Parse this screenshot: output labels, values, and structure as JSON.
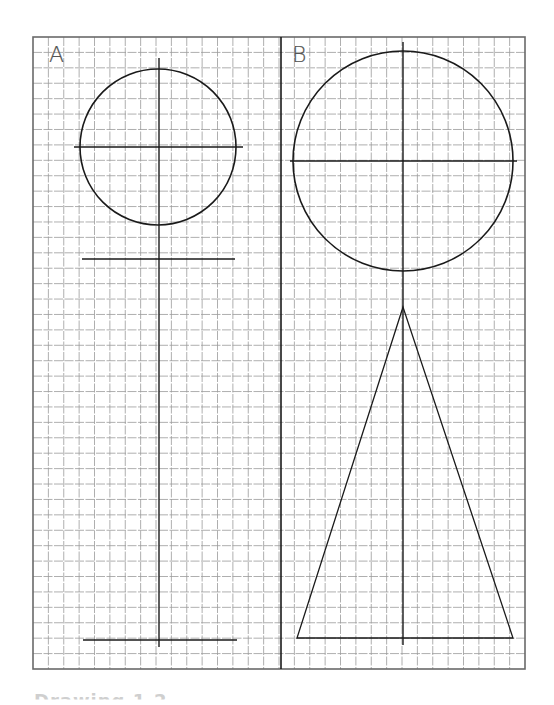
{
  "figure": {
    "panels": [
      {
        "label": "A",
        "circle": {
          "cx": 158,
          "cy": 147,
          "r": 78
        },
        "axis_vertical": {
          "x": 159,
          "y1": 58,
          "y2": 647
        },
        "axis_horizontal": {
          "y": 147,
          "x1": 74,
          "x2": 243
        },
        "top_line": {
          "y": 259,
          "x1": 82,
          "x2": 235
        },
        "bottom_line": {
          "y": 640,
          "x1": 83,
          "x2": 237
        }
      },
      {
        "label": "B",
        "circle": {
          "cx": 403,
          "cy": 161,
          "r": 110
        },
        "axis_vertical": {
          "x": 403,
          "y1": 42,
          "y2": 645
        },
        "axis_horizontal": {
          "y": 161,
          "x1": 290,
          "x2": 517
        },
        "triangle": {
          "apex": [
            403,
            307
          ],
          "base_left": [
            297,
            638
          ],
          "base_right": [
            513,
            638
          ]
        }
      }
    ],
    "grid": {
      "x": 33,
      "y": 37,
      "width": 492,
      "height": 632,
      "cell": 15.4,
      "line_color": "#9a9a9a",
      "frame_color": "#6a6a6a"
    },
    "divider_x": 281,
    "ink_color": "#1a1a1a"
  },
  "caption": {
    "text": "Drawing 1.2"
  }
}
